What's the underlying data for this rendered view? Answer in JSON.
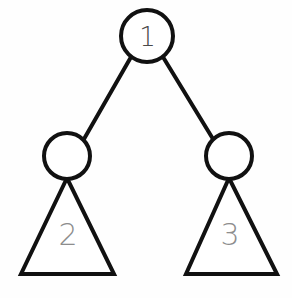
{
  "diagram": {
    "background_color": "#fefefe",
    "stroke_color": "#111111",
    "node_fill_color": "#ffffff",
    "root_label_color": "#4a4a4a",
    "subtree_label_color": "#8d8d8d",
    "edge_stroke_width": "4",
    "circle_stroke_width": "4",
    "triangle_stroke_width": "4"
  },
  "nodes": [
    {
      "id": "root",
      "name": "root-node",
      "label": "1",
      "cx": 147,
      "cy": 36,
      "r": 26,
      "label_font_size": "26"
    },
    {
      "id": "left-child",
      "name": "left-child-node",
      "label": "",
      "cx": 67,
      "cy": 156,
      "r": 23,
      "label_font_size": "22"
    },
    {
      "id": "right-child",
      "name": "right-child-node",
      "label": "",
      "cx": 229,
      "cy": 156,
      "r": 23,
      "label_font_size": "22"
    }
  ],
  "edges": [
    {
      "id": "root-to-left",
      "name": "edge-root-to-left-child",
      "x1": 131,
      "y1": 57,
      "x2": 84,
      "y2": 139
    },
    {
      "id": "root-to-right",
      "name": "edge-root-to-right-child",
      "x1": 163,
      "y1": 57,
      "x2": 213,
      "y2": 139
    }
  ],
  "subtrees": [
    {
      "id": "left-subtree",
      "name": "left-subtree-triangle",
      "label": "2",
      "apex_x": 67,
      "apex_y": 178,
      "base_left_x": 21,
      "base_right_x": 114,
      "base_y": 274,
      "label_x": 68,
      "label_y": 234,
      "label_font_size": "30"
    },
    {
      "id": "right-subtree",
      "name": "right-subtree-triangle",
      "label": "3",
      "apex_x": 229,
      "apex_y": 178,
      "base_left_x": 186,
      "base_right_x": 277,
      "base_y": 274,
      "label_x": 230,
      "label_y": 234,
      "label_font_size": "30"
    }
  ]
}
